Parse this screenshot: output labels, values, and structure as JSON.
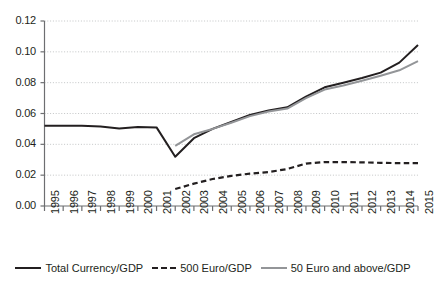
{
  "chart_data": {
    "type": "line",
    "title": "",
    "xlabel": "",
    "ylabel": "",
    "xlim": [
      1995,
      2015
    ],
    "ylim": [
      0.0,
      0.12
    ],
    "grid": true,
    "legend_position": "bottom",
    "x": [
      1995,
      1996,
      1997,
      1998,
      1999,
      2000,
      2001,
      2002,
      2003,
      2004,
      2005,
      2006,
      2007,
      2008,
      2009,
      2010,
      2011,
      2012,
      2013,
      2014,
      2015
    ],
    "y_ticks": [
      0.0,
      0.02,
      0.04,
      0.06,
      0.08,
      0.1,
      0.12
    ],
    "y_tick_labels": [
      "0.00",
      "0.02",
      "0.04",
      "0.06",
      "0.08",
      "0.10",
      "0.12"
    ],
    "x_tick_labels": [
      "1995",
      "1996",
      "1997",
      "1998",
      "1999",
      "2000",
      "2001",
      "2002",
      "2003",
      "2004",
      "2005",
      "2006",
      "2007",
      "2008",
      "2009",
      "2010",
      "2011",
      "2012",
      "2013",
      "2014",
      "2015"
    ],
    "series": [
      {
        "name": "Total Currency/GDP",
        "style": "solid",
        "color": "#231f20",
        "width": 2.0,
        "x": [
          1995,
          1996,
          1997,
          1998,
          1999,
          2000,
          2001,
          2002,
          2003,
          2004,
          2005,
          2006,
          2007,
          2008,
          2009,
          2010,
          2011,
          2012,
          2013,
          2014,
          2015
        ],
        "values": [
          0.052,
          0.0521,
          0.052,
          0.0515,
          0.0503,
          0.0512,
          0.051,
          0.032,
          0.044,
          0.05,
          0.0545,
          0.059,
          0.062,
          0.064,
          0.071,
          0.077,
          0.08,
          0.083,
          0.0865,
          0.093,
          0.1045
        ]
      },
      {
        "name": "500 Euro/GDP",
        "style": "dashed",
        "color": "#231f20",
        "width": 2.2,
        "x": [
          2002,
          2003,
          2004,
          2005,
          2006,
          2007,
          2008,
          2009,
          2010,
          2011,
          2012,
          2013,
          2014,
          2015
        ],
        "values": [
          0.011,
          0.0145,
          0.0175,
          0.0195,
          0.021,
          0.022,
          0.024,
          0.0275,
          0.0285,
          0.0285,
          0.0283,
          0.028,
          0.0278,
          0.0278
        ]
      },
      {
        "name": "50 Euro and above/GDP",
        "style": "solid",
        "color": "#939598",
        "width": 2.0,
        "x": [
          2002,
          2003,
          2004,
          2005,
          2006,
          2007,
          2008,
          2009,
          2010,
          2011,
          2012,
          2013,
          2014,
          2015
        ],
        "values": [
          0.039,
          0.0465,
          0.05,
          0.054,
          0.0583,
          0.0613,
          0.0632,
          0.07,
          0.0755,
          0.0782,
          0.0812,
          0.0845,
          0.088,
          0.094
        ]
      }
    ]
  },
  "legend": {
    "items": [
      {
        "label": "Total Currency/GDP",
        "color": "#231f20",
        "style": "solid"
      },
      {
        "label": "500 Euro/GDP",
        "color": "#231f20",
        "style": "dashed"
      },
      {
        "label": "50 Euro and above/GDP",
        "color": "#939598",
        "style": "solid"
      }
    ]
  },
  "axes": {
    "axis_color": "#6d6e71",
    "grid_color": "#bcbec0"
  }
}
